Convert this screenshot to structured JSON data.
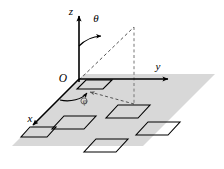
{
  "figure": {
    "type": "spherical-coordinate-diagram",
    "title": "",
    "background_color": "#ffffff",
    "stroke_color": "#000000",
    "plane": {
      "name": "xy-plane",
      "fill_color": "#d8d8d8",
      "points": "12,146 84,74 215,74 143,146"
    },
    "axes": [
      {
        "id": "z",
        "label": "z",
        "label_x": 73,
        "label_y": 15,
        "direction": "up"
      },
      {
        "id": "y",
        "label": "y",
        "label_x": 158,
        "label_y": 70,
        "direction": "right"
      },
      {
        "id": "x",
        "label": "x",
        "label_x": 30,
        "label_y": 122,
        "direction": "down-left"
      }
    ],
    "origin": {
      "label": "O",
      "label_x": 63,
      "label_y": 82,
      "x": 77,
      "y": 79
    },
    "angles": [
      {
        "id": "theta",
        "label": "θ",
        "label_x": 96,
        "label_y": 22,
        "description": "polar angle from z-axis to radial ray"
      },
      {
        "id": "phi",
        "label": "φ",
        "label_x": 85,
        "label_y": 103,
        "description": "azimuthal angle in xy-plane from x-axis"
      }
    ],
    "dashed_elements": [
      {
        "id": "radial-ray",
        "from": "origin",
        "to": "point-above-plane"
      },
      {
        "id": "drop-line",
        "from": "point-above-plane",
        "to": "plane-projection"
      },
      {
        "id": "projection-line",
        "from": "plane-projection",
        "to": "origin"
      }
    ],
    "tiles": {
      "count": 6,
      "stroke_color": "#000000",
      "fill_color": "none",
      "label": "surface patch",
      "items": [
        {
          "id": "tile-1",
          "points": "86,80 112,80 103,89 77,89"
        },
        {
          "id": "tile-2",
          "points": "64,116 96,116 84,129 52,129"
        },
        {
          "id": "tile-3",
          "points": "118,105 150,105 138,118 106,118"
        },
        {
          "id": "tile-4",
          "points": "96,139 128,139 116,152 84,152"
        },
        {
          "id": "tile-5",
          "points": "148,122 180,122 168,135 136,135"
        },
        {
          "id": "tile-6",
          "points": "30,127 56,127 47,137 21,137"
        }
      ]
    }
  }
}
